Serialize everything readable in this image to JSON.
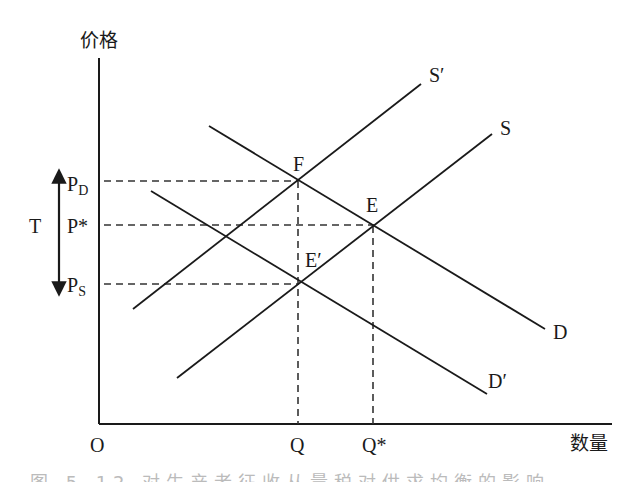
{
  "diagram": {
    "type": "supply-demand-tax",
    "axes": {
      "y_label": "价格",
      "x_label": "数量",
      "origin_label": "O"
    },
    "price_labels": {
      "pd": {
        "main": "P",
        "sub": "D"
      },
      "pstar": "P*",
      "ps": {
        "main": "P",
        "sub": "S"
      },
      "tax": "T"
    },
    "quantity_labels": {
      "q": "Q",
      "qstar": "Q*"
    },
    "curves": [
      {
        "id": "S_prime",
        "label": "S′",
        "from": [
          133,
          309
        ],
        "to": [
          421,
          84
        ]
      },
      {
        "id": "S",
        "label": "S",
        "from": [
          177,
          378
        ],
        "to": [
          492,
          134
        ]
      },
      {
        "id": "D",
        "label": "D",
        "from": [
          209,
          126
        ],
        "to": [
          545,
          329
        ]
      },
      {
        "id": "D_prime",
        "label": "D′",
        "from": [
          151,
          191
        ],
        "to": [
          487,
          394
        ]
      }
    ],
    "points": [
      {
        "id": "F",
        "label": "F",
        "x": 298,
        "y": 181
      },
      {
        "id": "E",
        "label": "E",
        "x": 374,
        "y": 226
      },
      {
        "id": "E_prime",
        "label": "E′",
        "x": 299,
        "y": 284
      }
    ],
    "colors": {
      "line": "#1a1a1a",
      "dash": "#333333"
    }
  },
  "caption": "图 5-12  对生产者征收从量税对供求均衡的影响"
}
